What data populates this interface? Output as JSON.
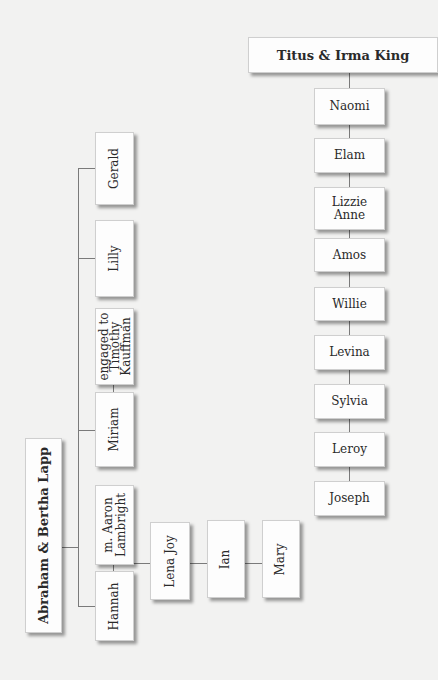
{
  "right_family": {
    "parents": "Titus & Irma King",
    "children": [
      "Naomi",
      "Elam",
      "Lizzie Anne",
      "Amos",
      "Willie",
      "Levina",
      "Sylvia",
      "Leroy",
      "Joseph"
    ]
  },
  "left_family": {
    "parents": "Abraham & Bertha Lapp",
    "children": {
      "gerald": "Gerald",
      "lilly": "Lilly",
      "miriam": "Miriam",
      "miriam_note_l1": "engaged to",
      "miriam_note_l2": "Timothy",
      "miriam_note_l3": "Kauffman",
      "hannah": "Hannah",
      "hannah_note_l1": "m. Aaron",
      "hannah_note_l2": "Lambright"
    },
    "grandchildren": [
      "Lena Joy",
      "Ian",
      "Mary"
    ]
  },
  "colors": {
    "background": "#f2f2f1",
    "box": "#fdfdfd",
    "line": "#7a7a7a"
  }
}
